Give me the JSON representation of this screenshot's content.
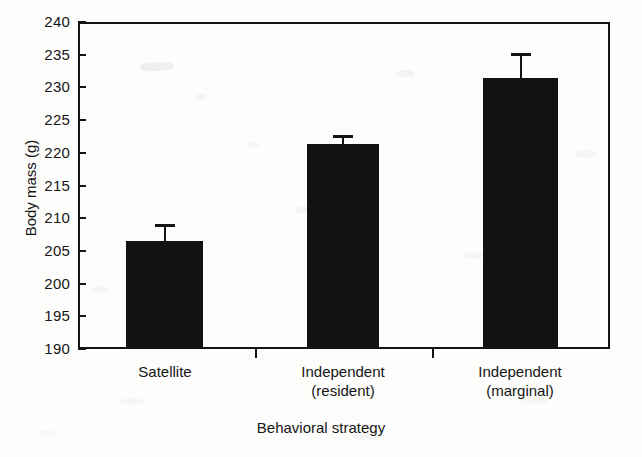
{
  "chart_data": {
    "type": "bar",
    "title": "",
    "xlabel": "Behavioral strategy",
    "ylabel": "Body mass (g)",
    "categories": [
      "Satellite",
      "Independent\n(resident)",
      "Independent\n(marginal)"
    ],
    "category_lines": [
      [
        "Satellite"
      ],
      [
        "Independent",
        "(resident)"
      ],
      [
        "Independent",
        "(marginal)"
      ]
    ],
    "values": [
      206.5,
      221.3,
      231.5
    ],
    "error_upper": [
      2.6,
      1.4,
      3.8
    ],
    "error_tops": [
      209.1,
      222.7,
      235.3
    ],
    "ylim": [
      190,
      240
    ],
    "yticks": [
      240,
      235,
      230,
      225,
      220,
      215,
      210,
      205,
      200,
      195,
      190
    ],
    "ytick_labels": [
      "240",
      "235",
      "230",
      "225",
      "220",
      "215",
      "210",
      "205",
      "200",
      "195",
      "190"
    ],
    "ytick_step": 5,
    "grid": false,
    "legend": false,
    "bar_color": "#121212",
    "axis_color": "#141414",
    "background_color": "#fdfdfc",
    "error_bar_style": "upper-only-with-cap",
    "series": [
      {
        "name": "Body mass",
        "values": [
          206.5,
          221.3,
          231.5
        ],
        "error_upper": [
          2.6,
          1.4,
          3.8
        ]
      }
    ]
  }
}
